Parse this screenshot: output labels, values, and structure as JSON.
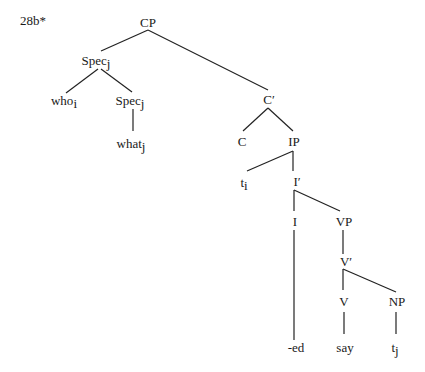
{
  "example_label": "28b*",
  "nodes": {
    "cp": {
      "label": "CP",
      "sub": ""
    },
    "spec1": {
      "label": "Spec",
      "sub": "j"
    },
    "who": {
      "label": "who",
      "sub": "i"
    },
    "spec2": {
      "label": "Spec",
      "sub": "j"
    },
    "what": {
      "label": "what",
      "sub": "j"
    },
    "cbar": {
      "label": "C′",
      "sub": ""
    },
    "c": {
      "label": "C",
      "sub": ""
    },
    "ip": {
      "label": "IP",
      "sub": ""
    },
    "ti": {
      "label": "t",
      "sub": "i"
    },
    "ibar": {
      "label": "I′",
      "sub": ""
    },
    "i": {
      "label": "I",
      "sub": ""
    },
    "vp": {
      "label": "VP",
      "sub": ""
    },
    "ed": {
      "label": "-ed",
      "sub": ""
    },
    "vbar": {
      "label": "V′",
      "sub": ""
    },
    "v": {
      "label": "V",
      "sub": ""
    },
    "np": {
      "label": "NP",
      "sub": ""
    },
    "say": {
      "label": "say",
      "sub": ""
    },
    "tj": {
      "label": "t",
      "sub": "j"
    }
  },
  "edges": [
    [
      "cp",
      "spec1"
    ],
    [
      "cp",
      "cbar"
    ],
    [
      "spec1",
      "who"
    ],
    [
      "spec1",
      "spec2"
    ],
    [
      "spec2",
      "what"
    ],
    [
      "cbar",
      "c"
    ],
    [
      "cbar",
      "ip"
    ],
    [
      "ip",
      "ti"
    ],
    [
      "ip",
      "ibar"
    ],
    [
      "ibar",
      "i"
    ],
    [
      "ibar",
      "vp"
    ],
    [
      "i",
      "ed"
    ],
    [
      "vp",
      "vbar"
    ],
    [
      "vbar",
      "v"
    ],
    [
      "vbar",
      "np"
    ],
    [
      "v",
      "say"
    ],
    [
      "np",
      "tj"
    ]
  ],
  "colors": {
    "ink": "#1a1a1a",
    "background": "#ffffff"
  }
}
